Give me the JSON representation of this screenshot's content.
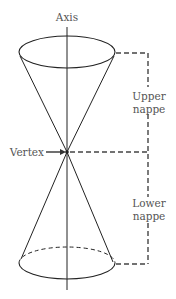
{
  "diagram": {
    "labels": {
      "axis": "Axis",
      "vertex": "Vertex",
      "upper_line1": "Upper",
      "upper_line2": "nappe",
      "lower_line1": "Lower",
      "lower_line2": "nappe"
    },
    "colors": {
      "line": "#222222",
      "text": "#555555",
      "bracket": "#444444"
    }
  }
}
